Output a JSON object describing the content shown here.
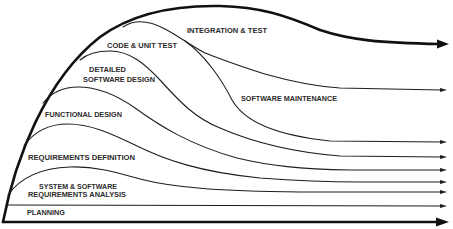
{
  "diagram": {
    "colors": {
      "line": "#1e1e1e",
      "text": "#2b2b2b",
      "background": "#ffffff"
    },
    "phases": {
      "integration_test": {
        "label": "INTEGRATION & TEST"
      },
      "code_unit_test": {
        "label": "CODE & UNIT TEST"
      },
      "detailed_software_design": {
        "lines": [
          "DETAILED",
          "SOFTWARE DESIGN"
        ]
      },
      "software_maintenance": {
        "label": "SOFTWARE MAINTENANCE"
      },
      "functional_design": {
        "label": "FUNCTIONAL DESIGN"
      },
      "requirements_definition": {
        "label": "REQUIREMENTS DEFINITION"
      },
      "system_software_requirements_analysis": {
        "lines": [
          "SYSTEM & SOFTWARE",
          "REQUIREMENTS ANALYSIS"
        ]
      },
      "planning": {
        "label": "PLANNING"
      }
    },
    "arrows": {
      "count": 9,
      "thick": [
        "top-envelope",
        "baseline"
      ],
      "thin_y_positions": [
        90,
        142,
        157,
        170,
        182,
        192,
        206
      ]
    }
  }
}
